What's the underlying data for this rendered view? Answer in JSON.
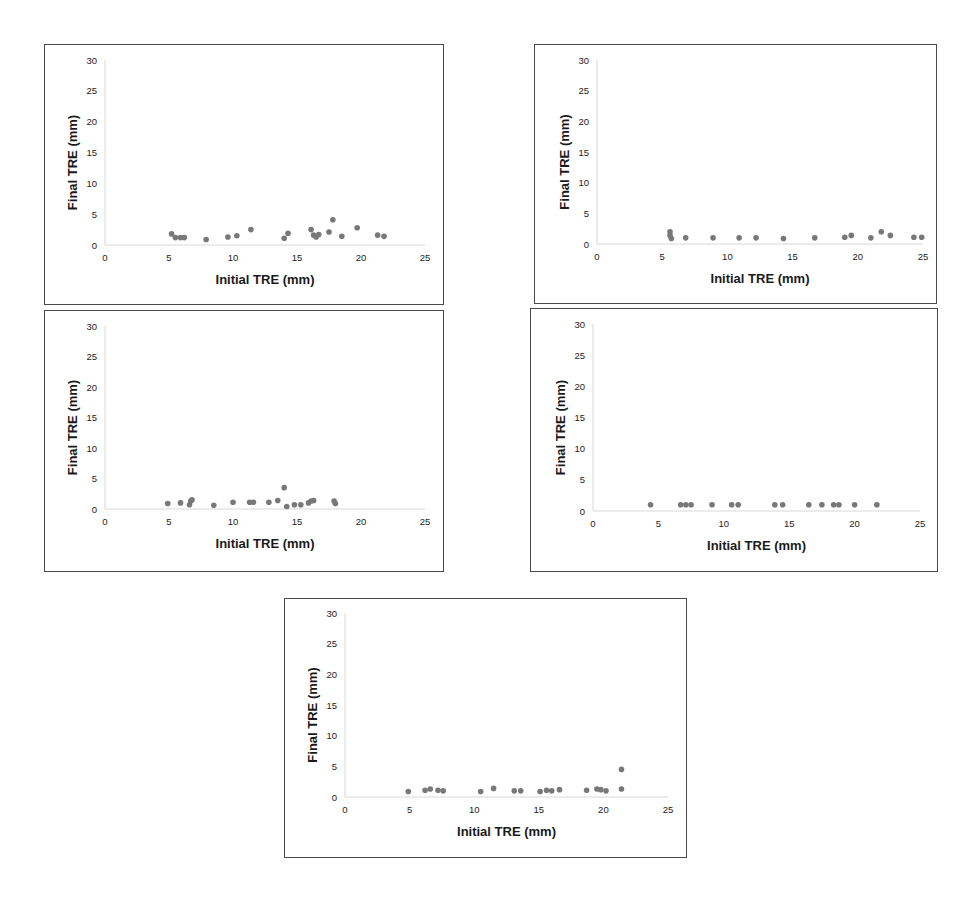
{
  "figure": {
    "panels_count": 5
  },
  "chart_data": [
    {
      "type": "scatter",
      "panel": "top-left",
      "title": "",
      "xlabel": "Initial TRE (mm)",
      "ylabel": "Final TRE (mm)",
      "xlim": [
        0,
        25
      ],
      "ylim": [
        0,
        30
      ],
      "xticks": [
        0,
        5,
        10,
        15,
        20,
        25
      ],
      "yticks": [
        0,
        5,
        10,
        15,
        20,
        25,
        30
      ],
      "grid": false,
      "legend": null,
      "points": [
        [
          5.2,
          1.8
        ],
        [
          5.5,
          1.2
        ],
        [
          5.9,
          1.2
        ],
        [
          6.2,
          1.2
        ],
        [
          7.9,
          0.9
        ],
        [
          9.6,
          1.3
        ],
        [
          10.3,
          1.5
        ],
        [
          11.4,
          2.5
        ],
        [
          14.0,
          1.1
        ],
        [
          14.3,
          1.9
        ],
        [
          16.1,
          2.5
        ],
        [
          16.3,
          1.6
        ],
        [
          16.5,
          1.3
        ],
        [
          16.7,
          1.7
        ],
        [
          17.5,
          2.1
        ],
        [
          17.8,
          4.1
        ],
        [
          18.5,
          1.4
        ],
        [
          19.7,
          2.8
        ],
        [
          21.3,
          1.6
        ],
        [
          21.8,
          1.4
        ]
      ]
    },
    {
      "type": "scatter",
      "panel": "top-right",
      "title": "",
      "xlabel": "Initial TRE (mm)",
      "ylabel": "Final TRE (mm)",
      "xlim": [
        0,
        25
      ],
      "ylim": [
        0,
        30
      ],
      "xticks": [
        0,
        5,
        10,
        15,
        20,
        25
      ],
      "yticks": [
        0,
        5,
        10,
        15,
        20,
        25,
        30
      ],
      "grid": false,
      "legend": null,
      "points": [
        [
          5.6,
          2.0
        ],
        [
          5.6,
          1.4
        ],
        [
          5.7,
          0.9
        ],
        [
          6.8,
          1.0
        ],
        [
          8.9,
          1.0
        ],
        [
          10.9,
          1.0
        ],
        [
          12.2,
          1.0
        ],
        [
          14.3,
          0.9
        ],
        [
          16.7,
          1.0
        ],
        [
          19.0,
          1.1
        ],
        [
          19.5,
          1.4
        ],
        [
          21.0,
          1.0
        ],
        [
          21.8,
          2.0
        ],
        [
          22.5,
          1.4
        ],
        [
          24.3,
          1.1
        ],
        [
          24.9,
          1.1
        ]
      ]
    },
    {
      "type": "scatter",
      "panel": "middle-left",
      "title": "",
      "xlabel": "Initial TRE (mm)",
      "ylabel": "Final TRE (mm)",
      "xlim": [
        0,
        25
      ],
      "ylim": [
        0,
        30
      ],
      "xticks": [
        0,
        5,
        10,
        15,
        20,
        25
      ],
      "yticks": [
        0,
        5,
        10,
        15,
        20,
        25,
        30
      ],
      "grid": false,
      "legend": null,
      "points": [
        [
          4.9,
          0.9
        ],
        [
          5.9,
          1.0
        ],
        [
          6.6,
          0.7
        ],
        [
          6.7,
          1.3
        ],
        [
          6.8,
          1.5
        ],
        [
          8.5,
          0.6
        ],
        [
          10.0,
          1.1
        ],
        [
          11.3,
          1.1
        ],
        [
          11.6,
          1.1
        ],
        [
          12.8,
          1.1
        ],
        [
          13.5,
          1.4
        ],
        [
          14.0,
          3.5
        ],
        [
          14.2,
          0.4
        ],
        [
          14.8,
          0.7
        ],
        [
          15.3,
          0.7
        ],
        [
          15.9,
          1.0
        ],
        [
          16.1,
          1.3
        ],
        [
          16.3,
          1.4
        ],
        [
          17.9,
          1.3
        ],
        [
          18.0,
          0.9
        ]
      ]
    },
    {
      "type": "scatter",
      "panel": "middle-right",
      "title": "",
      "xlabel": "Initial TRE (mm)",
      "ylabel": "Final TRE (mm)",
      "xlim": [
        0,
        25
      ],
      "ylim": [
        0,
        30
      ],
      "xticks": [
        0,
        5,
        10,
        15,
        20,
        25
      ],
      "yticks": [
        0,
        5,
        10,
        15,
        20,
        25,
        30
      ],
      "grid": false,
      "legend": null,
      "points": [
        [
          4.4,
          1.0
        ],
        [
          6.7,
          1.0
        ],
        [
          7.1,
          1.0
        ],
        [
          7.5,
          1.0
        ],
        [
          9.1,
          1.0
        ],
        [
          10.6,
          1.0
        ],
        [
          11.1,
          1.0
        ],
        [
          13.9,
          1.0
        ],
        [
          14.5,
          1.0
        ],
        [
          16.5,
          1.0
        ],
        [
          17.5,
          1.0
        ],
        [
          18.4,
          1.0
        ],
        [
          18.8,
          1.0
        ],
        [
          20.0,
          1.0
        ],
        [
          21.7,
          1.0
        ]
      ]
    },
    {
      "type": "scatter",
      "panel": "bottom-center",
      "title": "",
      "xlabel": "Initial TRE (mm)",
      "ylabel": "Final TRE (mm)",
      "xlim": [
        0,
        25
      ],
      "ylim": [
        0,
        30
      ],
      "xticks": [
        0,
        5,
        10,
        15,
        20,
        25
      ],
      "yticks": [
        0,
        5,
        10,
        15,
        20,
        25,
        30
      ],
      "grid": false,
      "legend": null,
      "points": [
        [
          4.9,
          0.9
        ],
        [
          6.2,
          1.1
        ],
        [
          6.6,
          1.3
        ],
        [
          7.2,
          1.1
        ],
        [
          7.6,
          1.0
        ],
        [
          10.5,
          0.9
        ],
        [
          11.5,
          1.4
        ],
        [
          13.1,
          1.0
        ],
        [
          13.6,
          1.0
        ],
        [
          15.1,
          0.9
        ],
        [
          15.6,
          1.1
        ],
        [
          16.0,
          1.0
        ],
        [
          16.6,
          1.2
        ],
        [
          18.7,
          1.1
        ],
        [
          19.5,
          1.3
        ],
        [
          19.8,
          1.2
        ],
        [
          20.2,
          1.0
        ],
        [
          21.4,
          4.5
        ],
        [
          21.4,
          1.3
        ]
      ]
    }
  ],
  "style": {
    "marker_color": "#787878",
    "border_color": "#4a4a4a",
    "axis_color": "#d8d8d8"
  }
}
